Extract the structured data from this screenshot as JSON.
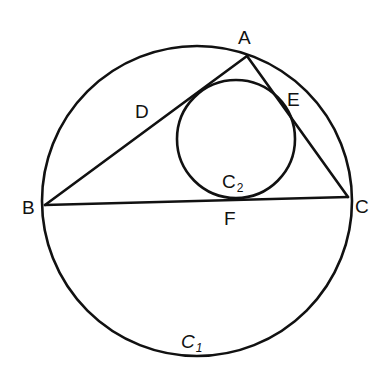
{
  "diagram": {
    "points": {
      "A": {
        "label": "A",
        "x": 247,
        "y": 56
      },
      "B": {
        "label": "B",
        "x": 45,
        "y": 205
      },
      "C": {
        "label": "C",
        "x": 348,
        "y": 197
      },
      "D": {
        "label": "D"
      },
      "E": {
        "label": "E"
      },
      "F": {
        "label": "F"
      }
    },
    "circles": {
      "C1": {
        "label": "C",
        "subscript": "1",
        "cx": 197,
        "cy": 201,
        "r": 155
      },
      "C2": {
        "label": "C",
        "subscript": "2",
        "cx": 236,
        "cy": 139,
        "r": 59
      }
    },
    "segments": [
      "AB",
      "BC",
      "CA"
    ]
  }
}
